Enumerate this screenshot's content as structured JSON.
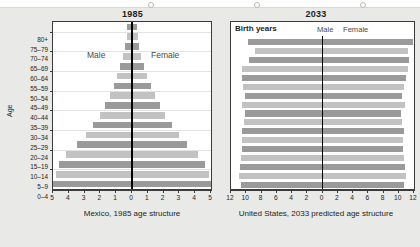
{
  "page": {
    "background": "#e9e9e7",
    "bar_dark": "#9a9a9a",
    "bar_light": "#c2c2c2",
    "axis_color": "#000000"
  },
  "left_panel": {
    "title": "1985",
    "caption": "Mexico, 1985 age structure",
    "axis_title": "Age",
    "male_label": "Male",
    "female_label": "Female"
  },
  "right_panel": {
    "title": "2033",
    "caption": "United States, 2033 predicted age structure",
    "header_label": "Birth years",
    "male_label": "Male",
    "female_label": "Female"
  },
  "chart_data": [
    {
      "type": "bar",
      "subtype": "population-pyramid",
      "title": "1985",
      "caption": "Mexico, 1985 age structure",
      "xlabel": "",
      "ylabel": "Age",
      "xlim": [
        -5,
        5
      ],
      "xticks": [
        5,
        4,
        3,
        2,
        1,
        0,
        1,
        2,
        3,
        4,
        5
      ],
      "grid": true,
      "legend": [
        "Male",
        "Female"
      ],
      "legend_position": "inside-upper",
      "categories": [
        "80+",
        "75–79",
        "70–74",
        "65–69",
        "60–64",
        "55–59",
        "50–54",
        "45–49",
        "40–44",
        "35–39",
        "30–34",
        "25–29",
        "20–24",
        "15–19",
        "10–14",
        "5–9",
        "0–4"
      ],
      "series": [
        {
          "name": "Male",
          "values": [
            0.3,
            0.33,
            0.44,
            0.56,
            0.75,
            0.95,
            1.15,
            1.4,
            1.7,
            2.05,
            2.45,
            2.9,
            3.45,
            4.15,
            4.6,
            4.8,
            5.0
          ]
        },
        {
          "name": "Female",
          "values": [
            0.32,
            0.35,
            0.46,
            0.58,
            0.78,
            0.98,
            1.18,
            1.45,
            1.75,
            2.1,
            2.5,
            2.95,
            3.5,
            4.2,
            4.65,
            4.85,
            5.0
          ]
        }
      ],
      "bar_shading": [
        "dark",
        "light",
        "dark",
        "light",
        "dark",
        "light",
        "dark",
        "light",
        "dark",
        "light",
        "dark",
        "light",
        "dark",
        "light",
        "dark",
        "light",
        "dark"
      ]
    },
    {
      "type": "bar",
      "subtype": "population-pyramid",
      "title": "2033",
      "caption": "United States, 2033 predicted age structure",
      "xlabel": "",
      "ylabel": "Birth years",
      "xlim": [
        -12,
        12
      ],
      "xticks": [
        12,
        10,
        8,
        6,
        4,
        2,
        0,
        2,
        4,
        6,
        8,
        10,
        12
      ],
      "grid": false,
      "legend": [
        "Male",
        "Female"
      ],
      "legend_position": "top",
      "categories": [
        "before 1954",
        "1954–58",
        "1959–63",
        "1964–68",
        "1969–73",
        "1974–78",
        "1979–83",
        "1984–88",
        "1989–93",
        "1994–98",
        "1999–2003",
        "2004–08",
        "2009–13",
        "2014–18",
        "2019–23",
        "2024–28",
        "2029–33"
      ],
      "series": [
        {
          "name": "Male",
          "values": [
            9.8,
            8.9,
            9.6,
            10.6,
            10.5,
            10.4,
            10.2,
            10.6,
            10.2,
            10.3,
            10.6,
            10.5,
            10.6,
            10.7,
            10.8,
            10.9,
            10.7
          ]
        },
        {
          "name": "Female",
          "values": [
            11.9,
            11.2,
            11.4,
            11.2,
            10.9,
            10.7,
            10.4,
            10.8,
            10.3,
            10.4,
            10.7,
            10.6,
            10.6,
            10.7,
            10.8,
            10.9,
            10.7
          ]
        }
      ],
      "bar_shading": [
        "dark",
        "light",
        "dark",
        "light",
        "dark",
        "light",
        "dark",
        "light",
        "dark",
        "light",
        "dark",
        "light",
        "dark",
        "light",
        "dark",
        "light",
        "dark"
      ]
    }
  ]
}
